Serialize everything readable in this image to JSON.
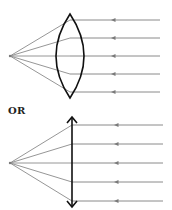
{
  "figure": {
    "separator_label": "OR",
    "colors": {
      "lens": "#111111",
      "ray": "#8a8a8a",
      "arrow": "#7a7a7a"
    },
    "diagrams": [
      {
        "name": "biconvex-lens-diagram",
        "lens_type": "biconvex",
        "ray_count": 5,
        "ray_direction": "right-to-left"
      },
      {
        "name": "thin-lens-diagram",
        "lens_type": "thin-lens-double-arrow",
        "ray_count": 5,
        "ray_direction": "right-to-left"
      }
    ]
  }
}
